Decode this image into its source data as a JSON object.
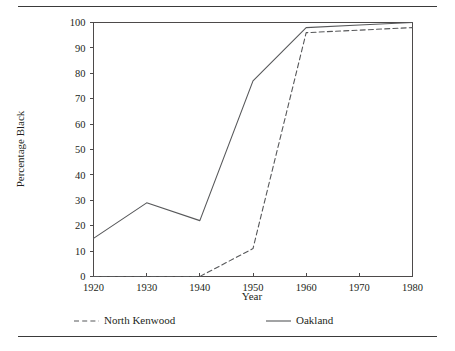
{
  "chart_data": {
    "type": "line",
    "title": "",
    "xlabel": "Year",
    "ylabel": "Percentage Black",
    "x": [
      1920,
      1930,
      1940,
      1950,
      1960,
      1970,
      1980
    ],
    "xtick_labels": [
      "1920",
      "1930",
      "1940",
      "1950",
      "1960",
      "1970",
      "1980"
    ],
    "ytick_labels": [
      "0",
      "10",
      "20",
      "30",
      "40",
      "50",
      "60",
      "70",
      "80",
      "90",
      "100"
    ],
    "ytick_values": [
      0,
      10,
      20,
      30,
      40,
      50,
      60,
      70,
      80,
      90,
      100
    ],
    "xlim": [
      1920,
      1980
    ],
    "ylim": [
      0,
      100
    ],
    "grid": false,
    "legend_position": "below-axis",
    "series": [
      {
        "name": "North Kenwood",
        "style": "dashed",
        "color": "#57585a",
        "values": [
          0,
          0,
          0,
          11,
          96,
          97,
          98
        ]
      },
      {
        "name": "Oakland",
        "style": "solid",
        "color": "#57585a",
        "values": [
          15,
          29,
          22,
          77,
          98,
          99,
          100
        ]
      }
    ]
  },
  "legend": {
    "entries": [
      {
        "label": "North Kenwood",
        "style": "dashed"
      },
      {
        "label": "Oakland",
        "style": "solid"
      }
    ]
  },
  "colors": {
    "line": "#57585a",
    "axis": "#4d4a4a",
    "rule": "#3a3a3a",
    "text": "#231f20",
    "background": "#ffffff"
  }
}
